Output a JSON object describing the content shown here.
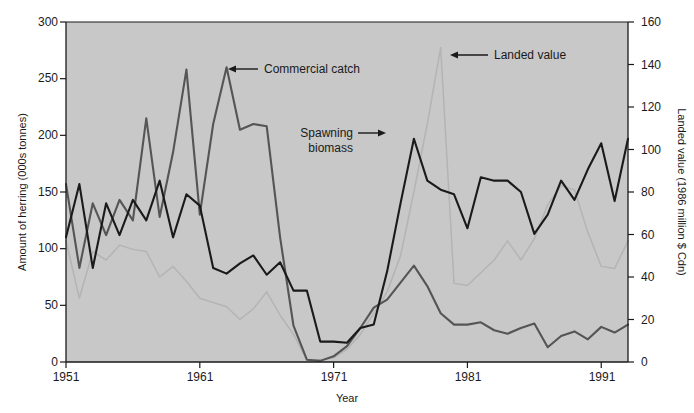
{
  "chart_data": {
    "type": "line",
    "title": "",
    "subtitle": "",
    "xlabel": "Year",
    "ylabel": "Amount of herring (000s tonnes)",
    "y2label": "Landed value (1986 million $ Cdn)",
    "xlim": [
      1951,
      1993
    ],
    "ylim": [
      0,
      300
    ],
    "y2lim": [
      0,
      160
    ],
    "grid": false,
    "legend_position": "inline-annotations",
    "xticks": [
      1951,
      1961,
      1971,
      1981,
      1991
    ],
    "xticklabels": [
      "1951",
      "1961",
      "1971",
      "1981",
      "1991"
    ],
    "yticks": [
      0,
      50,
      100,
      150,
      200,
      250,
      300
    ],
    "yticklabels": [
      "0",
      "50",
      "100",
      "150",
      "200",
      "250",
      "300"
    ],
    "y2ticks": [
      0,
      20,
      40,
      60,
      80,
      100,
      120,
      140,
      160
    ],
    "y2ticklabels": [
      "0",
      "20",
      "40",
      "60",
      "80",
      "100",
      "120",
      "140",
      "160"
    ],
    "plot_background": "#c8c8c8",
    "x": [
      1951,
      1952,
      1953,
      1954,
      1955,
      1956,
      1957,
      1958,
      1959,
      1960,
      1961,
      1962,
      1963,
      1964,
      1965,
      1966,
      1967,
      1968,
      1969,
      1970,
      1971,
      1972,
      1973,
      1974,
      1975,
      1976,
      1977,
      1978,
      1979,
      1980,
      1981,
      1982,
      1983,
      1984,
      1985,
      1986,
      1987,
      1988,
      1989,
      1990,
      1991,
      1992,
      1993
    ],
    "series": [
      {
        "name": "Spawning biomass",
        "axis": "left",
        "color": "#1a1a1a",
        "units": "000s tonnes",
        "values": [
          110,
          157,
          83,
          140,
          112,
          143,
          125,
          160,
          110,
          148,
          138,
          83,
          78,
          87,
          94,
          77,
          88,
          63,
          63,
          18,
          18,
          17,
          30,
          33,
          80,
          140,
          197,
          160,
          152,
          148,
          118,
          163,
          160,
          160,
          150,
          113,
          130,
          160,
          143,
          170,
          193,
          142,
          197
        ]
      },
      {
        "name": "Commercial catch",
        "axis": "left",
        "color": "#555555",
        "units": "000s tonnes",
        "values": [
          157,
          83,
          140,
          112,
          143,
          125,
          215,
          128,
          185,
          258,
          130,
          210,
          260,
          205,
          210,
          208,
          110,
          32,
          2,
          1,
          5,
          14,
          30,
          48,
          55,
          70,
          85,
          67,
          43,
          33,
          33,
          35,
          28,
          25,
          30,
          34,
          13,
          23,
          27,
          20,
          31,
          26,
          33
        ]
      },
      {
        "name": "Landed value",
        "axis": "right",
        "color": "#b4b4b4",
        "units": "1986 million $ Cdn",
        "values": [
          57,
          30,
          52,
          48,
          55,
          53,
          52,
          40,
          45,
          38,
          30,
          28,
          26,
          20,
          25,
          33,
          22,
          13,
          1,
          1,
          2,
          6,
          13,
          23,
          33,
          50,
          80,
          112,
          148,
          37,
          36,
          42,
          48,
          57,
          48,
          58,
          74,
          83,
          81,
          61,
          45,
          44,
          57
        ]
      }
    ],
    "annotations": [
      {
        "text": "Commercial catch",
        "target_year": 1963,
        "target_value": 260,
        "direction": "left"
      },
      {
        "text_line1": "Spawning",
        "text_line2": "biomass",
        "target_year": 1977,
        "target_value": 197,
        "direction": "right"
      },
      {
        "text": "Landed value",
        "target_year": 1979,
        "target_value": 148,
        "direction": "left"
      }
    ]
  },
  "labels": {
    "y_axis_title": "Amount of herring (000s tonnes)",
    "y2_axis_title": "Landed value (1986 million $ Cdn)",
    "x_axis_title": "Year",
    "annot_commercial": "Commercial catch",
    "annot_spawning_1": "Spawning",
    "annot_spawning_2": "biomass",
    "annot_landed": "Landed value",
    "ytick_0": "0",
    "ytick_50": "50",
    "ytick_100": "100",
    "ytick_150": "150",
    "ytick_200": "200",
    "ytick_250": "250",
    "ytick_300": "300",
    "y2tick_0": "0",
    "y2tick_20": "20",
    "y2tick_40": "40",
    "y2tick_60": "60",
    "y2tick_80": "80",
    "y2tick_100": "100",
    "y2tick_120": "120",
    "y2tick_140": "140",
    "y2tick_160": "160",
    "xtick_1951": "1951",
    "xtick_1961": "1961",
    "xtick_1971": "1971",
    "xtick_1981": "1981",
    "xtick_1991": "1991"
  }
}
